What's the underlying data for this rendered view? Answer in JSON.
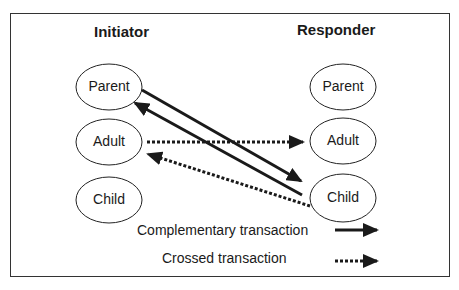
{
  "diagram": {
    "columns": {
      "left": {
        "title": "Initiator"
      },
      "right": {
        "title": "Responder"
      }
    },
    "initiator_states": [
      {
        "label": "Parent"
      },
      {
        "label": "Adult"
      },
      {
        "label": "Child"
      }
    ],
    "responder_states": [
      {
        "label": "Parent"
      },
      {
        "label": "Adult"
      },
      {
        "label": "Child"
      }
    ],
    "edges": [
      {
        "from": "Initiator.Parent",
        "to": "Responder.Child",
        "style": "solid",
        "type": "complementary"
      },
      {
        "from": "Responder.Child",
        "to": "Initiator.Parent",
        "style": "solid",
        "type": "complementary"
      },
      {
        "from": "Initiator.Adult",
        "to": "Responder.Adult",
        "style": "dotted",
        "type": "crossed"
      },
      {
        "from": "Responder.Child",
        "to": "Initiator.Adult",
        "style": "dotted",
        "type": "crossed"
      }
    ],
    "legend": {
      "complementary": "Complementary transaction",
      "crossed": "Crossed transaction"
    },
    "colors": {
      "line": "#1a1a1a",
      "frame": "#333333",
      "background": "#ffffff"
    }
  }
}
